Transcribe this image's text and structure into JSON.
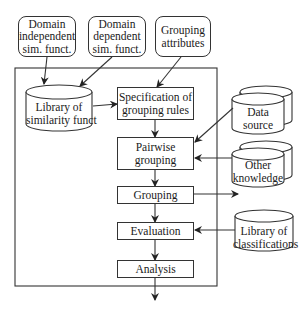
{
  "inputs": {
    "domain_independent": [
      "Domain",
      "independent",
      "sim. funct."
    ],
    "domain_dependent": [
      "Domain",
      "dependent",
      "sim. funct."
    ],
    "grouping_attributes": [
      "Grouping",
      "attributes"
    ]
  },
  "stores": {
    "library_similarity": [
      "Library of",
      "similarity funct"
    ],
    "data_source": [
      "Data",
      "source"
    ],
    "other_knowledge": [
      "Other",
      "knowledge"
    ],
    "library_classifications": [
      "Library of",
      "classifications"
    ]
  },
  "process": {
    "specification": [
      "Specification of",
      "grouping rules"
    ],
    "pairwise": [
      "Pairwise",
      "grouping"
    ],
    "grouping": "Grouping",
    "evaluation": "Evaluation",
    "analysis": "Analysis"
  }
}
